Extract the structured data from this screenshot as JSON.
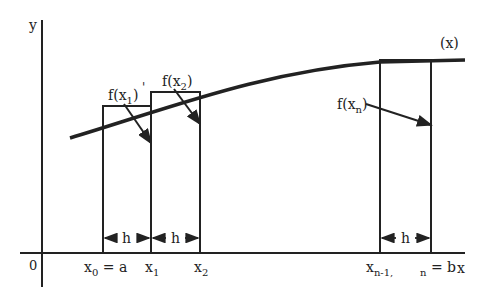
{
  "diagram": {
    "axes": {
      "y_label": "y",
      "x_label": "x",
      "origin_label": "0"
    },
    "curve_label": "(x)",
    "function_labels": {
      "f_x1": {
        "base": "f(x",
        "sub": "1",
        "close": ")"
      },
      "f_x2": {
        "base": "f(x",
        "sub": "2",
        "close": ")"
      },
      "f_xn": {
        "base": "f(x",
        "sub": "n",
        "close": ")"
      }
    },
    "x_ticks": {
      "x0": {
        "base": "x",
        "sub": "0",
        "suffix": " = a"
      },
      "x1": {
        "base": "x",
        "sub": "1"
      },
      "x2": {
        "base": "x",
        "sub": "2"
      },
      "xn1": {
        "base": "x",
        "sub": "n-1,"
      },
      "xn": {
        "sub": "n",
        "suffix": " = b"
      }
    },
    "interval_label": "h",
    "stray_mark": "'",
    "colors": {
      "stroke": "#222222",
      "background": "#ffffff"
    }
  }
}
